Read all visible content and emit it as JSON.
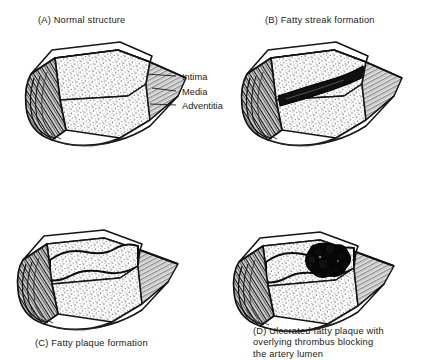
{
  "figure": {
    "background_color": "#ffffff",
    "ink_color": "#1a1a1a",
    "panel_count": 4
  },
  "panels": [
    {
      "key": "a",
      "letter": "(A)",
      "caption": "(A) Normal structure",
      "subject": "normal-artery",
      "description": "Longitudinally opened normal artery showing three concentric wall layers and an open lumen"
    },
    {
      "key": "b",
      "letter": "(B)",
      "caption": "(B) Fatty streak formation",
      "subject": "fatty-streak-artery",
      "description": "Artery with a dark lipid streak along the intimal surface"
    },
    {
      "key": "c",
      "letter": "(C)",
      "caption": "(C) Fatty plaque formation",
      "subject": "fatty-plaque-artery",
      "description": "Artery with a raised fatty plaque bulging into the lumen"
    },
    {
      "key": "d",
      "letter": "(D)",
      "caption": "(D) Ulcerated fatty plaque with\noverlying thrombus blocking\nthe artery lumen",
      "subject": "ulcerated-plaque-thrombus-artery",
      "description": "Artery with an ulcerated plaque capped by a dark occluding thrombus"
    }
  ],
  "callouts": {
    "panel": "a",
    "items": [
      {
        "label": "Intima",
        "layer_order": 1,
        "position": "innermost"
      },
      {
        "label": "Media",
        "layer_order": 2,
        "position": "middle"
      },
      {
        "label": "Adventitia",
        "layer_order": 3,
        "position": "outermost"
      }
    ]
  }
}
